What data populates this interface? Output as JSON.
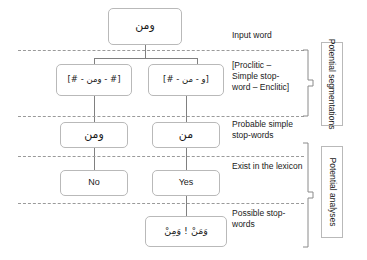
{
  "diagram": {
    "nodes": {
      "input_word": "ومن",
      "segmentation_left": "[# - ومن - #]",
      "segmentation_right": "[و - من - #]",
      "stopword_left": "ومن",
      "stopword_right": "من",
      "lexicon_left": "No",
      "lexicon_right": "Yes",
      "possible_stopwords": "وَمَنْ ! وَمِنْ"
    },
    "stages": [
      {
        "id": "input-word",
        "text": "Input word"
      },
      {
        "id": "potential-segmentations",
        "text": "[Proclitic – Simple stop-word – Enclitic]"
      },
      {
        "id": "probable-simple-stop-words",
        "text": "Probable simple stop-words"
      },
      {
        "id": "exist-in-the-lexicon",
        "text": "Exist in the lexicon"
      },
      {
        "id": "possible-stop-words",
        "text": "Possible stop-words"
      }
    ],
    "group_labels": [
      {
        "id": "potential-segmentations",
        "text": "Potential segmentations"
      },
      {
        "id": "potential-analyses",
        "text": "Potential analyses"
      }
    ],
    "colors": {
      "box_border": "#b9b9b9",
      "connector": "#808080",
      "separator": "#9a9a9a",
      "text": "#1a1a1a",
      "background": "#ffffff"
    }
  }
}
